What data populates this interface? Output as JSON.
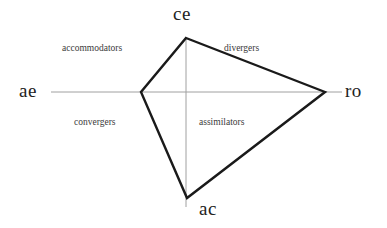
{
  "diagram": {
    "background_color": "#ffffff",
    "axis_color": "#a0a0a0",
    "polygon_color": "#1a1a1a",
    "label_color": "#222222",
    "quadrant_label_color": "#3a3a3a"
  },
  "axes": {
    "left": {
      "label": "ae"
    },
    "right": {
      "label": "ro"
    },
    "top": {
      "label": "ce"
    },
    "bottom": {
      "label": "ac"
    }
  },
  "quadrants": [
    {
      "id": "accommodators",
      "label": "accommodators"
    },
    {
      "id": "divergers",
      "label": "divergers"
    },
    {
      "id": "convergers",
      "label": "convergers"
    },
    {
      "id": "assimilators",
      "label": "assimilators"
    }
  ],
  "chart_data": {
    "type": "radar",
    "title": "",
    "axes": [
      "ce",
      "ro",
      "ac",
      "ae"
    ],
    "axis_labels": {
      "ce": "ce",
      "ro": "ro",
      "ac": "ac",
      "ae": "ae"
    },
    "center": {
      "x": 186,
      "y": 92
    },
    "series": [
      {
        "name": "learning style profile",
        "points": [
          {
            "axis": "ce",
            "x": 186,
            "y": 38,
            "radius": 54
          },
          {
            "axis": "ro",
            "x": 325,
            "y": 92,
            "radius": 139
          },
          {
            "axis": "ac",
            "x": 187,
            "y": 198,
            "radius": 106
          },
          {
            "axis": "ae",
            "x": 141,
            "y": 92,
            "radius": 45
          }
        ]
      }
    ],
    "axis_extents": {
      "horizontal": {
        "x1": 51,
        "x2": 342,
        "y": 92
      },
      "vertical": {
        "x": 186,
        "y1": 38,
        "y2": 207
      }
    },
    "annotations": [
      "accommodators",
      "divergers",
      "convergers",
      "assimilators"
    ],
    "grid": false,
    "legend": "none"
  }
}
